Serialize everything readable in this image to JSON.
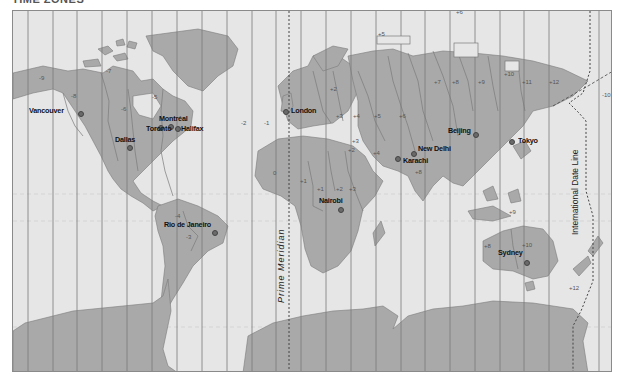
{
  "title": "TIME ZONES",
  "colors": {
    "ocean": "#e6e6e6",
    "land": "#a9a9a9",
    "land_border": "#7a7a7a",
    "zone_line": "#7a7a7a",
    "dashed_line": "#555555",
    "city_dot": "#6a6a6a",
    "text": "#111111"
  },
  "reference_lines": {
    "prime_meridian": "Prime Meridian",
    "date_line": "International Date Line"
  },
  "cities": [
    {
      "name": "Vancouver",
      "x": 28,
      "y": 110,
      "dot_x": 80,
      "dot_y": 113
    },
    {
      "name": "Montréal",
      "x": 158,
      "y": 118,
      "dot_x": 170,
      "dot_y": 126
    },
    {
      "name": "Toronto",
      "x": 145,
      "y": 128,
      "dot_x": 160,
      "dot_y": 127
    },
    {
      "name": "Halifax",
      "x": 180,
      "y": 128,
      "dot_x": 177,
      "dot_y": 128
    },
    {
      "name": "Dallas",
      "x": 114,
      "y": 139,
      "dot_x": 129,
      "dot_y": 147
    },
    {
      "name": "London",
      "x": 290,
      "y": 110,
      "dot_x": 285,
      "dot_y": 111
    },
    {
      "name": "Rio de Janeiro",
      "x": 163,
      "y": 224,
      "dot_x": 214,
      "dot_y": 232
    },
    {
      "name": "Nairobi",
      "x": 318,
      "y": 200,
      "dot_x": 340,
      "dot_y": 209
    },
    {
      "name": "Karachi",
      "x": 402,
      "y": 160,
      "dot_x": 397,
      "dot_y": 158
    },
    {
      "name": "New Delhi",
      "x": 417,
      "y": 148,
      "dot_x": 413,
      "dot_y": 153
    },
    {
      "name": "Beijing",
      "x": 447,
      "y": 130,
      "dot_x": 475,
      "dot_y": 134
    },
    {
      "name": "Tokyo",
      "x": 517,
      "y": 140,
      "dot_x": 511,
      "dot_y": 141
    },
    {
      "name": "Sydney",
      "x": 497,
      "y": 252,
      "dot_x": 526,
      "dot_y": 262
    }
  ],
  "time_zone_labels": [
    {
      "label": "-9",
      "x": 38,
      "y": 74
    },
    {
      "label": "-8",
      "x": 70,
      "y": 92
    },
    {
      "label": "-7",
      "x": 105,
      "y": 67
    },
    {
      "label": "-6",
      "x": 120,
      "y": 105
    },
    {
      "label": "-5",
      "x": 151,
      "y": 93
    },
    {
      "label": "-4",
      "x": 174,
      "y": 212
    },
    {
      "label": "-3",
      "x": 185,
      "y": 233
    },
    {
      "label": "-2",
      "x": 240,
      "y": 119
    },
    {
      "label": "-1",
      "x": 263,
      "y": 119
    },
    {
      "label": "0",
      "x": 272,
      "y": 169
    },
    {
      "label": "+1",
      "x": 299,
      "y": 177
    },
    {
      "label": "+1",
      "x": 316,
      "y": 185
    },
    {
      "label": "+2",
      "x": 335,
      "y": 185
    },
    {
      "label": "+3",
      "x": 348,
      "y": 185
    },
    {
      "label": "+2",
      "x": 347,
      "y": 146
    },
    {
      "label": "+3",
      "x": 351,
      "y": 137
    },
    {
      "label": "+3",
      "x": 335,
      "y": 112
    },
    {
      "label": "+2",
      "x": 329,
      "y": 85
    },
    {
      "label": "+4",
      "x": 352,
      "y": 112
    },
    {
      "label": "+4",
      "x": 372,
      "y": 149
    },
    {
      "label": "+5",
      "x": 373,
      "y": 112
    },
    {
      "label": "+6",
      "x": 398,
      "y": 112
    },
    {
      "label": "+5",
      "x": 377,
      "y": 30
    },
    {
      "label": "+6",
      "x": 455,
      "y": 8
    },
    {
      "label": "+7",
      "x": 433,
      "y": 78
    },
    {
      "label": "+8",
      "x": 451,
      "y": 78
    },
    {
      "label": "+9",
      "x": 477,
      "y": 78
    },
    {
      "label": "+10",
      "x": 503,
      "y": 70
    },
    {
      "label": "+11",
      "x": 521,
      "y": 78
    },
    {
      "label": "+12",
      "x": 548,
      "y": 78
    },
    {
      "label": "-10",
      "x": 601,
      "y": 91
    },
    {
      "label": "+8",
      "x": 414,
      "y": 168
    },
    {
      "label": "+9",
      "x": 508,
      "y": 208
    },
    {
      "label": "+8",
      "x": 483,
      "y": 242
    },
    {
      "label": "+10",
      "x": 521,
      "y": 241
    },
    {
      "label": "+12",
      "x": 568,
      "y": 284
    }
  ]
}
